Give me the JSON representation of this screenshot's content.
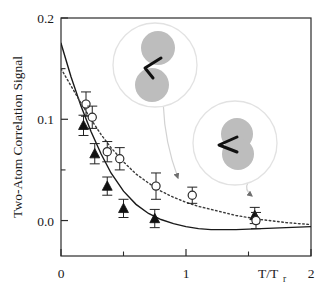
{
  "chart_data": {
    "type": "scatter",
    "title": "",
    "xlabel": "T/Tr",
    "xlabel_main": "T/T",
    "xlabel_sub": "r",
    "ylabel": "Two-Atom Correlation Signal",
    "xlim": [
      0,
      2
    ],
    "ylim": [
      -0.035,
      0.2
    ],
    "xticks": [
      0,
      1,
      2
    ],
    "xtick_labels": [
      "0",
      "1",
      "2"
    ],
    "xminor_ticks": [
      0.5,
      1.5
    ],
    "yticks": [
      0.0,
      0.1,
      0.2
    ],
    "ytick_labels": [
      "0.0",
      "0.1",
      "0.2"
    ],
    "grid": false,
    "legend": "none",
    "series": [
      {
        "name": "filled-triangles",
        "marker": "triangle",
        "fill": "#111111",
        "curve_style": "solid",
        "points": [
          {
            "x": 0.18,
            "y": 0.094,
            "yerr": 0.01
          },
          {
            "x": 0.27,
            "y": 0.066,
            "yerr": 0.01
          },
          {
            "x": 0.37,
            "y": 0.034,
            "yerr": 0.009
          },
          {
            "x": 0.5,
            "y": 0.012,
            "yerr": 0.009
          },
          {
            "x": 0.75,
            "y": 0.002,
            "yerr": 0.009
          },
          {
            "x": 1.55,
            "y": 0.005,
            "yerr": 0.008
          }
        ]
      },
      {
        "name": "open-circles",
        "marker": "circle",
        "fill": "#ffffff",
        "curve_style": "dotted",
        "points": [
          {
            "x": 0.2,
            "y": 0.115,
            "yerr": 0.012
          },
          {
            "x": 0.25,
            "y": 0.102,
            "yerr": 0.011
          },
          {
            "x": 0.37,
            "y": 0.068,
            "yerr": 0.01
          },
          {
            "x": 0.47,
            "y": 0.061,
            "yerr": 0.011
          },
          {
            "x": 0.76,
            "y": 0.034,
            "yerr": 0.013
          },
          {
            "x": 1.05,
            "y": 0.025,
            "yerr": 0.008
          },
          {
            "x": 1.56,
            "y": 0.0,
            "yerr": 0.008
          }
        ]
      }
    ],
    "curves": [
      {
        "name": "solid-theory-curve",
        "style": "solid",
        "x": [
          0.0,
          0.08,
          0.16,
          0.24,
          0.32,
          0.4,
          0.5,
          0.6,
          0.7,
          0.8,
          0.9,
          1.0,
          1.1,
          1.2,
          1.4,
          1.6,
          1.8,
          2.0
        ],
        "y": [
          0.175,
          0.142,
          0.113,
          0.088,
          0.066,
          0.047,
          0.029,
          0.016,
          0.007,
          0.001,
          -0.003,
          -0.006,
          -0.008,
          -0.009,
          -0.009,
          -0.008,
          -0.007,
          -0.006
        ]
      },
      {
        "name": "dotted-theory-curve",
        "style": "dotted",
        "x": [
          0.0,
          0.08,
          0.16,
          0.24,
          0.32,
          0.4,
          0.5,
          0.6,
          0.7,
          0.8,
          0.9,
          1.0,
          1.1,
          1.2,
          1.4,
          1.6,
          1.8,
          2.0
        ],
        "y": [
          0.15,
          0.133,
          0.116,
          0.1,
          0.085,
          0.072,
          0.058,
          0.046,
          0.037,
          0.029,
          0.023,
          0.018,
          0.014,
          0.011,
          0.005,
          0.001,
          -0.002,
          -0.004
        ]
      }
    ],
    "insets": [
      {
        "name": "separated-atoms-inset",
        "description": "two separated gray circles joined by a black zigzag bond",
        "cx": 155,
        "cy": 65,
        "r": 42,
        "atom_fill": "#bdbdbd",
        "ring_stroke": "#e2e2e2",
        "leader_to": {
          "x": 178,
          "y": 178
        }
      },
      {
        "name": "overlapping-atoms-inset",
        "description": "two overlapping gray circles with a black arrowhead bond",
        "cx": 235,
        "cy": 143,
        "r": 42,
        "atom_fill": "#bdbdbd",
        "ring_stroke": "#e2e2e2",
        "leader_to": {
          "x": 252,
          "y": 196
        }
      }
    ],
    "colors": {
      "axis": "#2b2b2b",
      "marker_dark": "#111111",
      "marker_open_stroke": "#2b2b2b",
      "curve_solid": "#1a1a1a",
      "curve_dotted": "#3a3a3a",
      "inset_atom": "#bdbdbd",
      "inset_ring": "#e2e2e2"
    }
  },
  "figure": {
    "background": "#ffffff"
  }
}
